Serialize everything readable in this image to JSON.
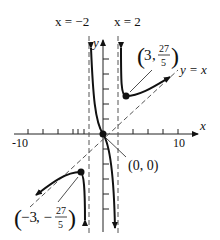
{
  "figure": {
    "function": "f(x) = x^3 / (x^2 - 4)",
    "axes": {
      "x_label": "x",
      "y_label": "y",
      "x_tick_labels": [
        "-10",
        "10"
      ],
      "x_range": [
        -10,
        10
      ]
    },
    "asymptotes": {
      "vertical_left": "x = −2",
      "vertical_right": "x = 2",
      "slant": "y = x"
    },
    "points": {
      "origin": "(0, 0)",
      "local_min": {
        "x": "3",
        "num": "27",
        "den": "5"
      },
      "local_max": {
        "x": "−3",
        "num": "27",
        "den": "5"
      }
    }
  },
  "colors": {
    "curve": "#111111",
    "dashed": "#555555",
    "axis": "#222222"
  }
}
